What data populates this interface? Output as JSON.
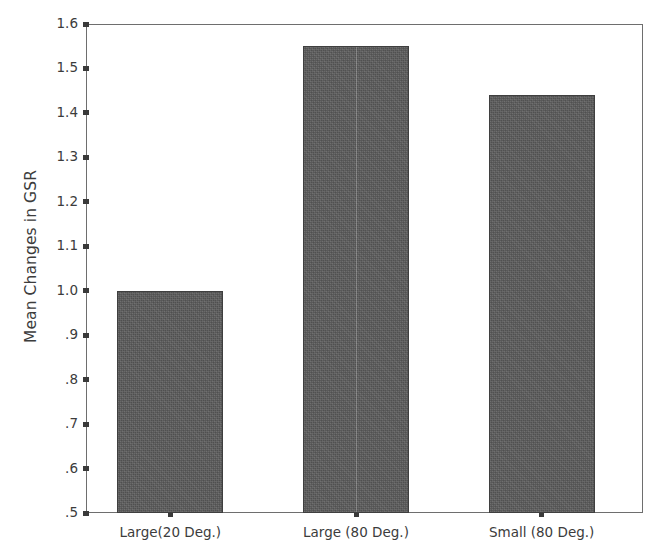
{
  "chart_data": {
    "type": "bar",
    "title": "",
    "xlabel": "",
    "ylabel": "Mean Changes in GSR",
    "categories": [
      "Large(20 Deg.)",
      "Large (80 Deg.)",
      "Small (80 Deg.)"
    ],
    "values": [
      1.0,
      1.55,
      1.44
    ],
    "ylim": [
      0.5,
      1.6
    ],
    "ytick_values": [
      0.5,
      0.6,
      0.7,
      0.8,
      0.9,
      1.0,
      1.1,
      1.2,
      1.3,
      1.4,
      1.5,
      1.6
    ],
    "ytick_labels": [
      ".5",
      ".6",
      ".7",
      ".8",
      ".9",
      "1.0",
      "1.1",
      "1.2",
      "1.3",
      "1.4",
      "1.5",
      "1.6"
    ],
    "grid": false,
    "legend": false,
    "legend_position": "none",
    "bar_color": "#5a5a5a",
    "bar_edge_color": "#3f3f3f",
    "axis_color": "#6e6e6e",
    "background_color": "#ffffff",
    "series": [
      {
        "name": "Mean Changes in GSR",
        "values": [
          1.0,
          1.55,
          1.44
        ]
      }
    ]
  }
}
